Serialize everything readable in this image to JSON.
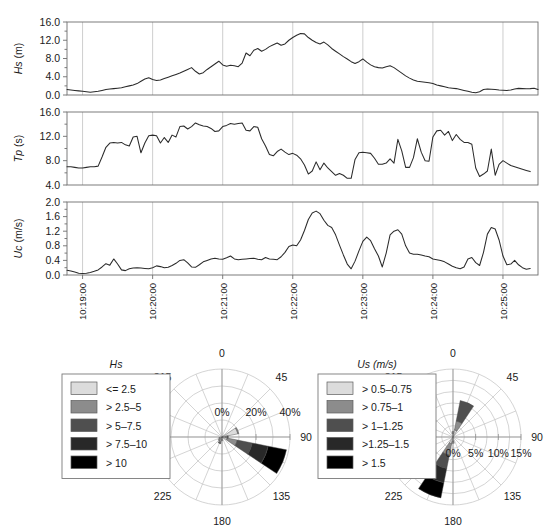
{
  "chart_data": [
    {
      "type": "line",
      "title": "",
      "ylabel": "Hs",
      "yunit": "(m)",
      "xlabel": "",
      "ylim": [
        0,
        16
      ],
      "yticks": [
        "0.0",
        "4.0",
        "8.0",
        "12.0",
        "16.0"
      ],
      "ytickvals": [
        0,
        4,
        8,
        12,
        16
      ],
      "grid": true,
      "x": [
        0,
        1,
        2,
        3,
        4,
        5,
        6,
        7,
        8,
        9,
        10,
        11,
        12,
        13,
        14,
        15,
        16,
        17,
        18,
        19,
        20,
        21,
        22,
        23,
        24,
        25,
        26,
        27,
        28,
        29,
        30,
        31,
        32,
        33,
        34,
        35,
        36,
        37,
        38,
        39,
        40,
        41,
        42,
        43,
        44,
        45,
        46,
        47,
        48,
        49,
        50,
        51,
        52,
        53,
        54,
        55,
        56,
        57,
        58,
        59,
        60,
        61,
        62,
        63,
        64,
        65,
        66,
        67,
        68,
        69,
        70,
        71,
        72,
        73,
        74,
        75,
        76,
        77,
        78,
        79,
        80,
        81,
        82,
        83,
        84,
        85,
        86,
        87,
        88,
        89,
        90,
        91,
        92,
        93,
        94,
        95,
        96,
        97,
        98,
        99,
        100,
        101,
        102,
        103,
        104,
        105,
        106,
        107,
        108,
        109,
        110,
        111,
        112,
        113,
        114,
        115,
        116,
        117,
        118,
        119
      ],
      "values": [
        1.2,
        1.1,
        1.0,
        0.9,
        0.8,
        0.7,
        0.6,
        0.7,
        0.8,
        1.0,
        1.2,
        1.3,
        1.4,
        1.5,
        1.6,
        1.8,
        2.0,
        2.2,
        2.5,
        3.0,
        3.5,
        3.8,
        3.4,
        3.2,
        3.3,
        3.6,
        3.9,
        4.2,
        4.5,
        4.8,
        5.2,
        5.6,
        6.0,
        5.2,
        4.6,
        4.9,
        5.6,
        6.2,
        6.8,
        7.4,
        6.6,
        6.3,
        6.5,
        6.4,
        6.2,
        7.0,
        9.2,
        8.6,
        9.8,
        10.2,
        9.6,
        10.0,
        10.6,
        11.0,
        11.4,
        10.9,
        11.2,
        12.0,
        12.6,
        13.1,
        13.5,
        13.4,
        12.6,
        12.0,
        11.5,
        11.2,
        11.6,
        11.0,
        10.2,
        9.6,
        9.0,
        8.4,
        7.9,
        7.3,
        6.9,
        7.3,
        7.9,
        7.2,
        6.6,
        6.2,
        6.0,
        5.9,
        6.2,
        6.4,
        6.0,
        5.4,
        4.8,
        4.2,
        3.7,
        3.3,
        3.0,
        2.9,
        2.8,
        2.7,
        2.5,
        2.2,
        2.0,
        1.8,
        1.6,
        1.5,
        1.4,
        1.2,
        1.0,
        0.8,
        0.6,
        0.5,
        0.7,
        1.2,
        1.3,
        1.25,
        1.2,
        1.1,
        1.05,
        1.0,
        1.1,
        1.3,
        1.45,
        1.4,
        1.35,
        1.4,
        1.5,
        1.2
      ]
    },
    {
      "type": "line",
      "title": "",
      "ylabel": "Tp",
      "yunit": "(s)",
      "xlabel": "",
      "ylim": [
        4,
        16
      ],
      "yticks": [
        "4.0",
        "8.0",
        "12.0",
        "16.0"
      ],
      "ytickvals": [
        4,
        8,
        12,
        16
      ],
      "grid": true,
      "x": [
        0,
        1,
        2,
        3,
        4,
        5,
        6,
        7,
        8,
        9,
        10,
        11,
        12,
        13,
        14,
        15,
        16,
        17,
        18,
        19,
        20,
        21,
        22,
        23,
        24,
        25,
        26,
        27,
        28,
        29,
        30,
        31,
        32,
        33,
        34,
        35,
        36,
        37,
        38,
        39,
        40,
        41,
        42,
        43,
        44,
        45,
        46,
        47,
        48,
        49,
        50,
        51,
        52,
        53,
        54,
        55,
        56,
        57,
        58,
        59,
        60,
        61,
        62,
        63,
        64,
        65,
        66,
        67,
        68,
        69,
        70,
        71,
        72,
        73,
        74,
        75,
        76,
        77,
        78,
        79,
        80,
        81,
        82,
        83,
        84,
        85,
        86,
        87,
        88,
        89,
        90,
        91,
        92,
        93,
        94,
        95,
        96,
        97,
        98,
        99,
        100,
        101,
        102,
        103,
        104,
        105,
        106,
        107,
        108,
        109,
        110,
        111,
        112,
        113,
        114,
        115,
        116,
        117,
        118,
        119
      ],
      "values": [
        7.0,
        7.0,
        6.9,
        6.8,
        6.8,
        6.9,
        7.0,
        7.0,
        7.1,
        8.6,
        10.2,
        10.9,
        11.0,
        10.9,
        11.0,
        10.6,
        10.4,
        11.9,
        12.0,
        9.3,
        10.9,
        12.1,
        12.2,
        12.1,
        10.9,
        11.8,
        11.0,
        12.2,
        11.9,
        13.6,
        13.7,
        13.2,
        13.6,
        14.2,
        13.9,
        13.7,
        13.6,
        13.3,
        12.8,
        12.9,
        13.6,
        13.8,
        14.1,
        14.0,
        14.1,
        14.2,
        13.0,
        12.9,
        13.6,
        13.5,
        11.6,
        10.4,
        9.0,
        8.8,
        9.5,
        9.9,
        9.4,
        9.0,
        9.2,
        8.9,
        8.3,
        7.3,
        5.8,
        6.3,
        7.8,
        6.5,
        7.6,
        6.8,
        6.2,
        5.6,
        5.9,
        5.6,
        5.1,
        5.1,
        8.2,
        9.3,
        9.4,
        9.3,
        9.2,
        8.4,
        7.4,
        7.4,
        7.6,
        8.3,
        7.6,
        11.5,
        9.6,
        6.9,
        6.9,
        8.5,
        11.6,
        9.4,
        8.0,
        7.9,
        11.9,
        12.9,
        13.0,
        12.2,
        12.8,
        11.3,
        12.3,
        11.5,
        11.0,
        11.0,
        10.7,
        6.8,
        5.4,
        5.8,
        6.3,
        9.9,
        5.6,
        7.4,
        8.0,
        7.6,
        7.2,
        7.0,
        6.8,
        6.6,
        6.4,
        6.2
      ]
    },
    {
      "type": "line",
      "title": "",
      "ylabel": "Uc",
      "yunit": "(m/s)",
      "xlabel": "",
      "ylim": [
        0,
        2.0
      ],
      "yticks": [
        "0.0",
        "0.4",
        "0.8",
        "1.2",
        "1.6",
        "2.0"
      ],
      "ytickvals": [
        0,
        0.4,
        0.8,
        1.2,
        1.6,
        2.0
      ],
      "grid": true,
      "x": [
        0,
        1,
        2,
        3,
        4,
        5,
        6,
        7,
        8,
        9,
        10,
        11,
        12,
        13,
        14,
        15,
        16,
        17,
        18,
        19,
        20,
        21,
        22,
        23,
        24,
        25,
        26,
        27,
        28,
        29,
        30,
        31,
        32,
        33,
        34,
        35,
        36,
        37,
        38,
        39,
        40,
        41,
        42,
        43,
        44,
        45,
        46,
        47,
        48,
        49,
        50,
        51,
        52,
        53,
        54,
        55,
        56,
        57,
        58,
        59,
        60,
        61,
        62,
        63,
        64,
        65,
        66,
        67,
        68,
        69,
        70,
        71,
        72,
        73,
        74,
        75,
        76,
        77,
        78,
        79,
        80,
        81,
        82,
        83,
        84,
        85,
        86,
        87,
        88,
        89,
        90,
        91,
        92,
        93,
        94,
        95,
        96,
        97,
        98,
        99,
        100,
        101,
        102,
        103,
        104,
        105,
        106,
        107,
        108,
        109,
        110,
        111,
        112,
        113,
        114,
        115,
        116,
        117,
        118,
        119
      ],
      "values": [
        0.13,
        0.11,
        0.08,
        0.05,
        0.04,
        0.05,
        0.07,
        0.1,
        0.14,
        0.22,
        0.31,
        0.27,
        0.44,
        0.3,
        0.14,
        0.12,
        0.17,
        0.19,
        0.2,
        0.19,
        0.18,
        0.17,
        0.2,
        0.25,
        0.23,
        0.2,
        0.21,
        0.26,
        0.32,
        0.4,
        0.42,
        0.33,
        0.22,
        0.21,
        0.28,
        0.36,
        0.4,
        0.44,
        0.46,
        0.44,
        0.43,
        0.47,
        0.52,
        0.44,
        0.42,
        0.43,
        0.44,
        0.45,
        0.46,
        0.43,
        0.42,
        0.48,
        0.44,
        0.43,
        0.42,
        0.5,
        0.62,
        0.78,
        0.82,
        0.8,
        0.96,
        1.22,
        1.52,
        1.7,
        1.75,
        1.68,
        1.5,
        1.36,
        1.3,
        1.1,
        0.82,
        0.55,
        0.3,
        0.17,
        0.38,
        0.66,
        0.92,
        1.04,
        0.94,
        0.72,
        0.52,
        0.22,
        0.6,
        1.1,
        1.2,
        1.24,
        1.12,
        0.8,
        0.6,
        0.57,
        0.57,
        0.55,
        0.52,
        0.5,
        0.44,
        0.42,
        0.4,
        0.36,
        0.3,
        0.24,
        0.2,
        0.17,
        0.22,
        0.44,
        0.48,
        0.34,
        0.26,
        0.62,
        1.12,
        1.3,
        1.26,
        0.96,
        0.52,
        0.28,
        0.3,
        0.4,
        0.28,
        0.2,
        0.16,
        0.18
      ]
    },
    {
      "type": "rose",
      "title": "Hs",
      "compass_labels": [
        "0",
        "45",
        "90",
        "135",
        "180",
        "225",
        "270",
        "315"
      ],
      "radial_ticks": [
        "0%",
        "20%",
        "40%"
      ],
      "radial_max": 40,
      "legend_title": "Hs",
      "legend": [
        {
          "label": "<= 2.5",
          "color": "#dcdcdc"
        },
        {
          "label": "> 2.5–5",
          "color": "#8c8c8c"
        },
        {
          "label": "> 5–7.5",
          "color": "#4f4f4f"
        },
        {
          "label": "> 7.5–10",
          "color": "#282828"
        },
        {
          "label": "> 10",
          "color": "#000000"
        }
      ],
      "petals": [
        {
          "direction": 67.5,
          "segments": [
            9.5,
            0.6,
            0,
            0,
            0
          ]
        },
        {
          "direction": 112.5,
          "segments": [
            3.2,
            6.0,
            9.0,
            9.5,
            11.0
          ]
        },
        {
          "direction": 202.5,
          "segments": [
            2.6,
            1.0,
            0.4,
            0,
            0
          ]
        },
        {
          "direction": 225,
          "segments": [
            2.0,
            0.8,
            0,
            0,
            0
          ]
        },
        {
          "direction": 247.5,
          "segments": [
            1.4,
            0.5,
            0,
            0,
            0
          ]
        },
        {
          "direction": 180,
          "segments": [
            1.6,
            0.5,
            0,
            0,
            0
          ]
        },
        {
          "direction": 90,
          "segments": [
            2.2,
            1.0,
            0.5,
            0,
            0
          ]
        }
      ]
    },
    {
      "type": "rose",
      "title": "Us (m/s)",
      "compass_labels": [
        "0",
        "45",
        "90",
        "135",
        "180",
        "225",
        "270",
        "315"
      ],
      "radial_ticks": [
        "0%",
        "5%",
        "10%",
        "15%"
      ],
      "radial_max": 15,
      "legend_title": "Us (m/s)",
      "legend": [
        {
          "label": "> 0.5–0.75",
          "color": "#dcdcdc"
        },
        {
          "label": "> 0.75–1",
          "color": "#8c8c8c"
        },
        {
          "label": "> 1–1.25",
          "color": "#4f4f4f"
        },
        {
          "label": ">1.25–1.5",
          "color": "#282828"
        },
        {
          "label": "> 1.5",
          "color": "#000000"
        }
      ],
      "petals": [
        {
          "direction": 22.5,
          "segments": [
            1.6,
            2.0,
            4.6,
            0,
            0
          ]
        },
        {
          "direction": 202.5,
          "segments": [
            1.5,
            2.6,
            3.0,
            3.2,
            3.4
          ]
        },
        {
          "direction": 0,
          "segments": [
            0.8,
            0.4,
            0,
            0,
            0
          ]
        },
        {
          "direction": 180,
          "segments": [
            0.9,
            0.5,
            0,
            0,
            0
          ]
        }
      ]
    }
  ],
  "time_axis": {
    "labels": [
      "10:19:00",
      "10:20:00",
      "10:21:00",
      "10:22:00",
      "10:23:00",
      "10:24:00",
      "10:25:00"
    ],
    "positions": [
      4,
      22,
      40,
      58,
      76,
      94,
      112
    ]
  }
}
